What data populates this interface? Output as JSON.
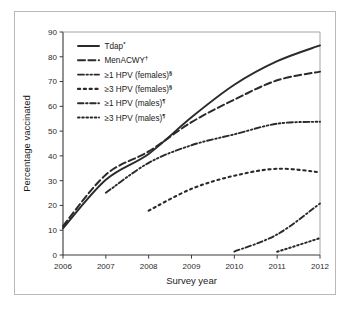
{
  "figure": {
    "background_color": "#ffffff",
    "frame_color": "#b9b9b9",
    "line_color": "#2a2a2a"
  },
  "axes": {
    "x_title": "Survey year",
    "y_title": "Percentage vaccinated",
    "x_ticks": [
      "2006",
      "2007",
      "2008",
      "2009",
      "2010",
      "2011",
      "2012"
    ],
    "y_ticks": [
      "0",
      "10",
      "20",
      "30",
      "40",
      "50",
      "60",
      "70",
      "80",
      "90"
    ]
  },
  "legend": {
    "items": [
      {
        "label": "Tdap",
        "sup": "*",
        "style": "solid"
      },
      {
        "label": "MenACWY",
        "sup": "†",
        "style": "dashed"
      },
      {
        "label": "≥1 HPV (females)",
        "sup": "§",
        "style": "dashdotdot"
      },
      {
        "label": "≥3 HPV (females)",
        "sup": "§",
        "style": "dotted-square"
      },
      {
        "label": "≥1 HPV (males)",
        "sup": "¶",
        "style": "dashdot"
      },
      {
        "label": "≥3 HPV (males)",
        "sup": "¶",
        "style": "dotted"
      }
    ]
  },
  "chart_data": {
    "type": "line",
    "title": "",
    "xlabel": "Survey year",
    "ylabel": "Percentage vaccinated",
    "x": [
      2006,
      2007,
      2008,
      2009,
      2010,
      2011,
      2012
    ],
    "xlim": [
      2006,
      2012
    ],
    "ylim": [
      0,
      90
    ],
    "y_ticks": [
      0,
      10,
      20,
      30,
      40,
      50,
      60,
      70,
      80,
      90
    ],
    "grid": false,
    "legend_position": "upper-left-inside",
    "series": [
      {
        "name": "Tdap*",
        "style": "solid",
        "x": [
          2006,
          2007,
          2008,
          2009,
          2010,
          2011,
          2012
        ],
        "values": [
          10.8,
          30.4,
          40.8,
          55.6,
          68.7,
          78.2,
          84.6
        ]
      },
      {
        "name": "MenACWY†",
        "style": "dashed",
        "x": [
          2006,
          2007,
          2008,
          2009,
          2010,
          2011,
          2012
        ],
        "values": [
          11.7,
          32.4,
          41.8,
          53.6,
          62.7,
          70.5,
          74.0
        ]
      },
      {
        "name": "≥1 HPV (females)§",
        "style": "dashdotdot",
        "x": [
          2007,
          2008,
          2009,
          2010,
          2011,
          2012
        ],
        "values": [
          25.1,
          37.2,
          44.3,
          48.7,
          53.0,
          53.8
        ]
      },
      {
        "name": "≥3 HPV (females)§",
        "style": "dotted-square",
        "x": [
          2008,
          2009,
          2010,
          2011,
          2012
        ],
        "values": [
          17.9,
          26.7,
          32.0,
          34.8,
          33.4
        ]
      },
      {
        "name": "≥1 HPV (males)¶",
        "style": "dashdot",
        "x": [
          2010,
          2011,
          2012
        ],
        "values": [
          1.4,
          8.3,
          20.8
        ]
      },
      {
        "name": "≥3 HPV (males)¶",
        "style": "dotted",
        "x": [
          2011,
          2012
        ],
        "values": [
          1.3,
          6.8
        ]
      }
    ]
  }
}
